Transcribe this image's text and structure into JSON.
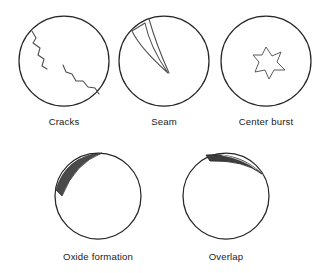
{
  "figure": {
    "background_color": "#ffffff",
    "outline_color": "#262626",
    "label_color": "#1a1a1a",
    "defect_fill_color": "#4a4a4a",
    "rows": [
      {
        "row_index": 1,
        "items": [
          {
            "id": "cracks",
            "label": "Cracks",
            "circle": {
              "cx": 64,
              "cy": 61,
              "r": 45
            },
            "label_position": {
              "x": 64,
              "y": 125
            },
            "marking": "two jagged crack lines inside the section",
            "marking_color": "#4a4a4a"
          },
          {
            "id": "seam",
            "label": "Seam",
            "circle": {
              "cx": 164,
              "cy": 61,
              "r": 45
            },
            "label_position": {
              "x": 164,
              "y": 125
            },
            "marking": "narrow wedge shaped sliver separated at upper left",
            "marking_color": "#4e4e4e"
          },
          {
            "id": "center-burst",
            "label": "Center burst",
            "circle": {
              "cx": 266,
              "cy": 61,
              "r": 45
            },
            "label_position": {
              "x": 266,
              "y": 125
            },
            "marking": "four pointed star shaped cavity at the center",
            "marking_color": "#5a5a5a"
          }
        ]
      },
      {
        "row_index": 2,
        "items": [
          {
            "id": "oxide-formation",
            "label": "Oxide formation",
            "circle": {
              "cx": 98,
              "cy": 196,
              "r": 43
            },
            "label_position": {
              "x": 98,
              "y": 260
            },
            "marking": "dark crescent of oxide along the upper left arc",
            "marking_color": "#4a4a4a"
          },
          {
            "id": "overlap",
            "label": "Overlap",
            "circle": {
              "cx": 226,
              "cy": 196,
              "r": 43
            },
            "label_position": {
              "x": 226,
              "y": 260
            },
            "marking": "dark folded lap with light seam line at the top right arc",
            "marking_color": "#3d3d3d"
          }
        ]
      }
    ]
  }
}
